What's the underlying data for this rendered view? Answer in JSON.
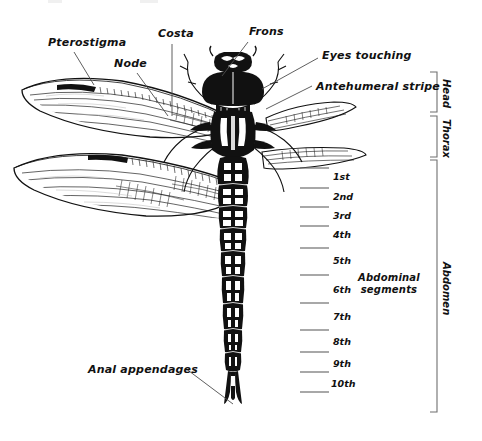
{
  "diagram": {
    "view": "dorsal",
    "background_color": "#ffffff",
    "ink_color": "#111111",
    "rule_color": "#8d8d8d"
  },
  "callouts": [
    {
      "id": "pterostigma",
      "label": "Pterostigma",
      "text_x": 48,
      "text_y": 37,
      "leader_from": [
        74,
        52
      ],
      "leader_to": [
        94,
        85
      ]
    },
    {
      "id": "node",
      "label": "Node",
      "text_x": 114,
      "text_y": 58,
      "leader_from": [
        137,
        73
      ],
      "leader_to": [
        168,
        116
      ]
    },
    {
      "id": "costa",
      "label": "Costa",
      "text_x": 158,
      "text_y": 28,
      "leader_from": [
        172,
        44
      ],
      "leader_to": [
        172,
        116
      ]
    },
    {
      "id": "frons",
      "label": "Frons",
      "text_x": 249,
      "text_y": 26,
      "leader_from": [
        248,
        42
      ],
      "leader_to": [
        222,
        76
      ]
    },
    {
      "id": "eyes-touching",
      "label": "Eyes touching",
      "text_x": 322,
      "text_y": 50,
      "leader_from": [
        318,
        58
      ],
      "leader_to": [
        262,
        89
      ]
    },
    {
      "id": "antehumeral-stripe",
      "label": "Antehumeral stripe",
      "text_x": 316,
      "text_y": 81,
      "leader_from": [
        312,
        86
      ],
      "leader_to": [
        266,
        109
      ]
    },
    {
      "id": "anal-appendages",
      "label": "Anal appendages",
      "text_x": 88,
      "text_y": 364,
      "leader_from": [
        185,
        368
      ],
      "leader_to": [
        233,
        404
      ]
    }
  ],
  "abdominal": {
    "group_label_line1": "Abdominal",
    "group_label_line2": "segments",
    "group_label_x": 389,
    "group_label_y": 272,
    "tick_x1": 300,
    "tick_x2": 329,
    "label_x": 333,
    "segments": [
      {
        "ordinal": "1st",
        "tick_y": 168,
        "label_y": 171
      },
      {
        "ordinal": "2nd",
        "tick_y": 188,
        "label_y": 191
      },
      {
        "ordinal": "3rd",
        "tick_y": 207,
        "label_y": 210
      },
      {
        "ordinal": "4th",
        "tick_y": 226,
        "label_y": 229
      },
      {
        "ordinal": "5th",
        "tick_y": 248,
        "label_y": 255
      },
      {
        "ordinal": "6th",
        "tick_y": 275,
        "label_y": 284
      },
      {
        "ordinal": "7th",
        "tick_y": 303,
        "label_y": 311
      },
      {
        "ordinal": "8th",
        "tick_y": 330,
        "label_y": 336
      },
      {
        "ordinal": "9th",
        "tick_y": 352,
        "label_y": 358
      },
      {
        "ordinal": "10th",
        "tick_y": 372,
        "label_y": 378
      },
      {
        "ordinal": "",
        "tick_y": 392,
        "label_y": 392
      }
    ]
  },
  "body_regions": {
    "bracket_x": 437,
    "tip_len": 7,
    "label_x": 450,
    "items": [
      {
        "id": "head",
        "label": "Head",
        "y_top": 72,
        "y_bottom": 112,
        "label_y": 79
      },
      {
        "id": "thorax",
        "label": "Thorax",
        "y_top": 116,
        "y_bottom": 157,
        "label_y": 119
      },
      {
        "id": "abdomen",
        "label": "Abdomen",
        "y_top": 160,
        "y_bottom": 412,
        "label_y": 262
      }
    ]
  }
}
